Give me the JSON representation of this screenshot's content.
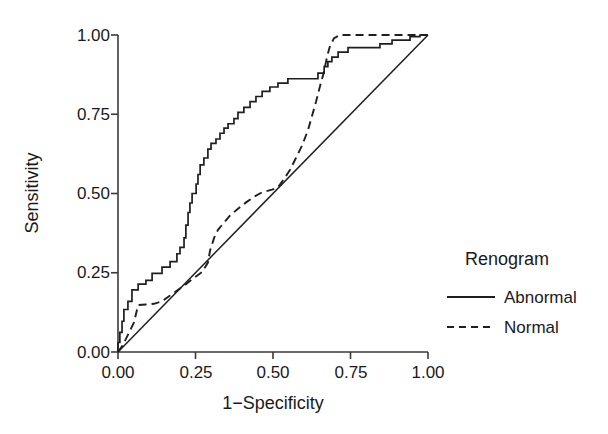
{
  "chart_data": {
    "type": "line",
    "title": "",
    "xlabel": "1−Specificity",
    "ylabel": "Sensitivity",
    "xlim": [
      0.0,
      1.0
    ],
    "ylim": [
      0.0,
      1.0
    ],
    "grid": false,
    "xticks": [
      "0.00",
      "0.25",
      "0.50",
      "0.75",
      "1.00"
    ],
    "xtick_values": [
      0.0,
      0.25,
      0.5,
      0.75,
      1.0
    ],
    "yticks": [
      "0.00",
      "0.25",
      "0.50",
      "0.75",
      "1.00"
    ],
    "ytick_values": [
      0.0,
      0.25,
      0.5,
      0.75,
      1.0
    ],
    "legend": {
      "title": "Renogram",
      "position": "right",
      "entries": [
        {
          "label": "Abnormal",
          "style": "solid"
        },
        {
          "label": "Normal",
          "style": "dashed"
        }
      ]
    },
    "annotations": [
      {
        "text": "reference diagonal",
        "style": "solid",
        "from": [
          0.0,
          0.0
        ],
        "to": [
          1.0,
          1.0
        ]
      }
    ],
    "series": [
      {
        "name": "Abnormal",
        "style": "solid",
        "points": [
          [
            0.0,
            0.0
          ],
          [
            0.0,
            0.03
          ],
          [
            0.006,
            0.03
          ],
          [
            0.006,
            0.062
          ],
          [
            0.013,
            0.062
          ],
          [
            0.013,
            0.097
          ],
          [
            0.019,
            0.097
          ],
          [
            0.019,
            0.134
          ],
          [
            0.032,
            0.134
          ],
          [
            0.032,
            0.16
          ],
          [
            0.045,
            0.16
          ],
          [
            0.045,
            0.196
          ],
          [
            0.065,
            0.196
          ],
          [
            0.065,
            0.214
          ],
          [
            0.09,
            0.214
          ],
          [
            0.09,
            0.226
          ],
          [
            0.11,
            0.226
          ],
          [
            0.11,
            0.248
          ],
          [
            0.142,
            0.248
          ],
          [
            0.142,
            0.268
          ],
          [
            0.168,
            0.268
          ],
          [
            0.168,
            0.285
          ],
          [
            0.19,
            0.285
          ],
          [
            0.19,
            0.31
          ],
          [
            0.2,
            0.31
          ],
          [
            0.2,
            0.33
          ],
          [
            0.213,
            0.33
          ],
          [
            0.213,
            0.36
          ],
          [
            0.219,
            0.36
          ],
          [
            0.219,
            0.4
          ],
          [
            0.226,
            0.4
          ],
          [
            0.226,
            0.44
          ],
          [
            0.232,
            0.44
          ],
          [
            0.232,
            0.47
          ],
          [
            0.239,
            0.47
          ],
          [
            0.239,
            0.5
          ],
          [
            0.252,
            0.5
          ],
          [
            0.252,
            0.53
          ],
          [
            0.258,
            0.53
          ],
          [
            0.258,
            0.56
          ],
          [
            0.265,
            0.56
          ],
          [
            0.265,
            0.59
          ],
          [
            0.277,
            0.59
          ],
          [
            0.277,
            0.612
          ],
          [
            0.29,
            0.612
          ],
          [
            0.29,
            0.64
          ],
          [
            0.3,
            0.64
          ],
          [
            0.3,
            0.658
          ],
          [
            0.316,
            0.658
          ],
          [
            0.316,
            0.672
          ],
          [
            0.329,
            0.672
          ],
          [
            0.329,
            0.69
          ],
          [
            0.342,
            0.69
          ],
          [
            0.342,
            0.706
          ],
          [
            0.355,
            0.706
          ],
          [
            0.355,
            0.72
          ],
          [
            0.374,
            0.72
          ],
          [
            0.374,
            0.736
          ],
          [
            0.387,
            0.736
          ],
          [
            0.387,
            0.756
          ],
          [
            0.406,
            0.756
          ],
          [
            0.406,
            0.772
          ],
          [
            0.426,
            0.772
          ],
          [
            0.426,
            0.79
          ],
          [
            0.445,
            0.79
          ],
          [
            0.445,
            0.806
          ],
          [
            0.465,
            0.806
          ],
          [
            0.465,
            0.822
          ],
          [
            0.49,
            0.822
          ],
          [
            0.49,
            0.836
          ],
          [
            0.516,
            0.836
          ],
          [
            0.516,
            0.848
          ],
          [
            0.548,
            0.848
          ],
          [
            0.548,
            0.862
          ],
          [
            0.645,
            0.862
          ],
          [
            0.645,
            0.88
          ],
          [
            0.665,
            0.88
          ],
          [
            0.665,
            0.9
          ],
          [
            0.677,
            0.9
          ],
          [
            0.677,
            0.916
          ],
          [
            0.69,
            0.916
          ],
          [
            0.69,
            0.93
          ],
          [
            0.71,
            0.93
          ],
          [
            0.71,
            0.946
          ],
          [
            0.742,
            0.946
          ],
          [
            0.742,
            0.96
          ],
          [
            0.845,
            0.96
          ],
          [
            0.845,
            0.972
          ],
          [
            0.884,
            0.972
          ],
          [
            0.884,
            0.984
          ],
          [
            0.942,
            0.984
          ],
          [
            0.942,
            0.995
          ],
          [
            0.974,
            0.995
          ],
          [
            0.974,
            1.0
          ],
          [
            1.0,
            1.0
          ]
        ]
      },
      {
        "name": "Normal",
        "style": "dashed",
        "points": [
          [
            0.0,
            0.0
          ],
          [
            0.013,
            0.018
          ],
          [
            0.026,
            0.042
          ],
          [
            0.039,
            0.068
          ],
          [
            0.052,
            0.094
          ],
          [
            0.058,
            0.12
          ],
          [
            0.065,
            0.148
          ],
          [
            0.09,
            0.15
          ],
          [
            0.116,
            0.152
          ],
          [
            0.142,
            0.16
          ],
          [
            0.168,
            0.178
          ],
          [
            0.194,
            0.196
          ],
          [
            0.219,
            0.214
          ],
          [
            0.245,
            0.234
          ],
          [
            0.271,
            0.252
          ],
          [
            0.29,
            0.282
          ],
          [
            0.297,
            0.32
          ],
          [
            0.31,
            0.36
          ],
          [
            0.323,
            0.386
          ],
          [
            0.342,
            0.408
          ],
          [
            0.361,
            0.43
          ],
          [
            0.387,
            0.452
          ],
          [
            0.413,
            0.472
          ],
          [
            0.439,
            0.49
          ],
          [
            0.465,
            0.504
          ],
          [
            0.497,
            0.512
          ],
          [
            0.516,
            0.52
          ],
          [
            0.535,
            0.545
          ],
          [
            0.555,
            0.575
          ],
          [
            0.574,
            0.612
          ],
          [
            0.594,
            0.652
          ],
          [
            0.613,
            0.7
          ],
          [
            0.626,
            0.745
          ],
          [
            0.639,
            0.79
          ],
          [
            0.652,
            0.84
          ],
          [
            0.665,
            0.886
          ],
          [
            0.674,
            0.93
          ],
          [
            0.684,
            0.966
          ],
          [
            0.697,
            0.99
          ],
          [
            0.716,
            1.0
          ],
          [
            0.8,
            1.0
          ],
          [
            0.9,
            1.0
          ],
          [
            1.0,
            1.0
          ]
        ]
      }
    ]
  }
}
